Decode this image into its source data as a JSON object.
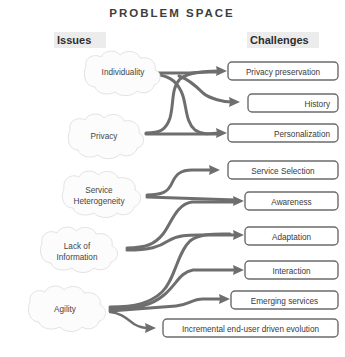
{
  "title": "PROBLEM SPACE",
  "columns": {
    "left_header": "Issues",
    "right_header": "Challenges"
  },
  "issues": [
    {
      "id": "individuality",
      "label": "Individuality",
      "label2": "",
      "cx": 123,
      "cy": 73
    },
    {
      "id": "privacy",
      "label": "Privacy",
      "label2": "",
      "cx": 106,
      "cy": 136
    },
    {
      "id": "service",
      "label": "Service",
      "label2": "Heterogeneity",
      "cx": 102,
      "cy": 196
    },
    {
      "id": "lack",
      "label": "Lack of",
      "label2": "Information",
      "cx": 80,
      "cy": 251
    },
    {
      "id": "agility",
      "label": "Agility",
      "label2": "",
      "cx": 67,
      "cy": 309
    }
  ],
  "challenges": [
    {
      "id": "privacy-preservation",
      "label": "Privacy preservation",
      "x": 228,
      "y": 62,
      "w": 110,
      "h": 18,
      "align": "center"
    },
    {
      "id": "history",
      "label": "History",
      "x": 248,
      "y": 94,
      "w": 90,
      "h": 18,
      "align": "right"
    },
    {
      "id": "personalization",
      "label": "Personalization",
      "x": 228,
      "y": 124,
      "w": 110,
      "h": 18,
      "align": "right"
    },
    {
      "id": "service-selection",
      "label": "Service Selection",
      "x": 228,
      "y": 161,
      "w": 110,
      "h": 18,
      "align": "center"
    },
    {
      "id": "awareness",
      "label": "Awareness",
      "x": 245,
      "y": 192,
      "w": 93,
      "h": 18,
      "align": "center"
    },
    {
      "id": "adaptation",
      "label": "Adaptation",
      "x": 245,
      "y": 227,
      "w": 93,
      "h": 18,
      "align": "center"
    },
    {
      "id": "interaction",
      "label": "Interaction",
      "x": 245,
      "y": 261,
      "w": 93,
      "h": 18,
      "align": "center"
    },
    {
      "id": "emerging-services",
      "label": "Emerging services",
      "x": 231,
      "y": 291,
      "w": 107,
      "h": 18,
      "align": "center"
    },
    {
      "id": "incremental",
      "label": "Incremental end-user driven evolution",
      "x": 163,
      "y": 319,
      "w": 175,
      "h": 18,
      "align": "center"
    }
  ],
  "flows": [
    {
      "id": "individuality-to-privacy-preservation",
      "from": "individuality",
      "to": "privacy-preservation"
    },
    {
      "id": "individuality-to-personalization",
      "from": "individuality",
      "to": "personalization"
    },
    {
      "id": "privacy-to-privacy-preservation",
      "from": "privacy",
      "to": "privacy-preservation"
    },
    {
      "id": "privacy-to-history",
      "from": "privacy",
      "to": "history"
    },
    {
      "id": "privacy-to-personalization",
      "from": "privacy",
      "to": "personalization"
    },
    {
      "id": "service-to-service-selection",
      "from": "service",
      "to": "service-selection"
    },
    {
      "id": "service-to-awareness",
      "from": "service",
      "to": "awareness"
    },
    {
      "id": "lack-to-adaptation",
      "from": "lack",
      "to": "adaptation"
    },
    {
      "id": "lack-to-awareness",
      "from": "lack",
      "to": "awareness"
    },
    {
      "id": "agility-to-adaptation",
      "from": "agility",
      "to": "adaptation"
    },
    {
      "id": "agility-to-interaction",
      "from": "agility",
      "to": "interaction"
    },
    {
      "id": "agility-to-emerging-services",
      "from": "agility",
      "to": "emerging-services"
    },
    {
      "id": "agility-to-incremental",
      "from": "agility",
      "to": "incremental"
    }
  ],
  "colors": {
    "arrow": "#6e6e6e",
    "box_border": "#6b6b6b",
    "cloud_fill": "#fcfcfc",
    "cloud_stroke": "#e3e3e3",
    "header_bg": "#ececec",
    "text": "#3a3a3a",
    "background": "#ffffff"
  }
}
